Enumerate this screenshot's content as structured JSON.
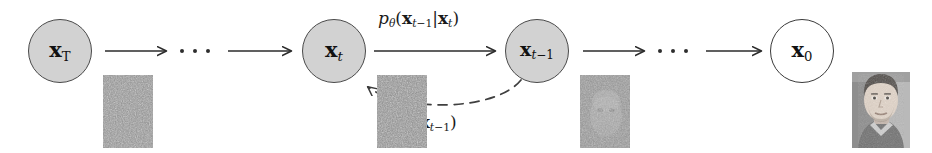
{
  "diagram": {
    "background_color": "#ffffff",
    "node_fill_gray": "#d2d2d2",
    "node_fill_white": "#ffffff",
    "stroke_color": "#4a4a4a",
    "nodes": [
      {
        "id": "xT",
        "var": "x",
        "subscript": "T",
        "filled": true,
        "cx": 60,
        "cy": 51,
        "r": 32
      },
      {
        "id": "xt",
        "var": "x",
        "subscript": "t",
        "filled": true,
        "cx": 334,
        "cy": 51,
        "r": 32
      },
      {
        "id": "xtm1",
        "var": "x",
        "subscript": "t−1",
        "filled": true,
        "cx": 537,
        "cy": 51,
        "r": 32
      },
      {
        "id": "x0",
        "var": "x",
        "subscript": "0",
        "filled": false,
        "cx": 802,
        "cy": 51,
        "r": 32
      }
    ],
    "labels": {
      "reverse": {
        "name": "p-theta-label",
        "base": "p",
        "theta": "θ",
        "argument": "(x",
        "full": "pθ(xt−1|xt)",
        "x": 378,
        "y": 10
      },
      "forward": {
        "name": "q-label",
        "base": "q",
        "full": "q(xt|xt−1)",
        "x": 382,
        "y": 114
      }
    },
    "arrows": [
      {
        "id": "xT-to-dots",
        "style": "solid",
        "x1": 105,
        "y1": 51,
        "x2": 168,
        "y2": 51
      },
      {
        "id": "dots-to-xt",
        "style": "solid",
        "x1": 228,
        "y1": 51,
        "x2": 293,
        "y2": 51
      },
      {
        "id": "xt-to-xtm1",
        "style": "solid",
        "x1": 374,
        "y1": 51,
        "x2": 497,
        "y2": 51
      },
      {
        "id": "xtm1-to-dots",
        "style": "solid",
        "x1": 583,
        "y1": 51,
        "x2": 646,
        "y2": 51
      },
      {
        "id": "dots-to-x0",
        "style": "solid",
        "x1": 706,
        "y1": 51,
        "x2": 763,
        "y2": 51
      },
      {
        "id": "xtm1-back-to-xt",
        "style": "dashed",
        "curved": true
      }
    ],
    "ellipses": [
      {
        "id": "ellipsis-left",
        "x": 180,
        "y": 49,
        "count": 3
      },
      {
        "id": "ellipsis-right",
        "x": 658,
        "y": 49,
        "count": 3
      }
    ],
    "swatches": [
      {
        "id": "noise-xT",
        "caption": "pure gaussian noise",
        "x": 103,
        "y": 75,
        "w": 50,
        "h": 73,
        "kind": "noise"
      },
      {
        "id": "noise-xt",
        "caption": "noisy sample at step t",
        "x": 377,
        "y": 75,
        "w": 50,
        "h": 73,
        "kind": "noise"
      },
      {
        "id": "noise-xtm1",
        "caption": "faint face emerging from noise",
        "x": 580,
        "y": 75,
        "w": 50,
        "h": 73,
        "kind": "faint-face"
      },
      {
        "id": "face-x0",
        "caption": "clean portrait photograph",
        "x": 852,
        "y": 72,
        "w": 58,
        "h": 76,
        "kind": "face"
      }
    ]
  }
}
